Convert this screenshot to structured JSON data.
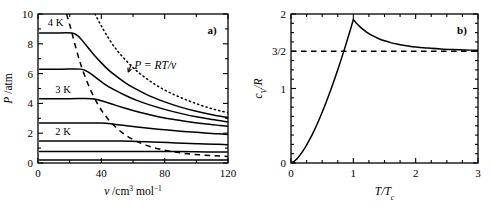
{
  "figure": {
    "panel_a_label": "a)",
    "panel_b_label": "b)"
  },
  "panel_a": {
    "xlabel_var": "v",
    "xlabel_unit": "/cm",
    "xlabel_unit_sup": "3",
    "xlabel_unit_tail": " mol",
    "xlabel_unit_sup2": "−1",
    "ylabel_var": "P",
    "ylabel_unit": "/atm",
    "xticklabels": [
      "0",
      "40",
      "80",
      "120"
    ],
    "yticklabels": [
      "0",
      "2",
      "4",
      "6",
      "8",
      "10"
    ],
    "curve_labels": [
      "4 K",
      "3 K",
      "2 K"
    ],
    "annotation": "P = RT/v"
  },
  "panel_b": {
    "xlabel": "T/T",
    "xlabel_sub": "c",
    "ylabel_var": "c",
    "ylabel_sub": "V",
    "ylabel_tail": "/R",
    "xticklabels": [
      "0",
      "1",
      "2",
      "3"
    ],
    "yticklabels": [
      "0",
      "1",
      "3/2",
      "2"
    ]
  },
  "chart_data": [
    {
      "type": "line",
      "title": "a) Isotherms of a condensing gas",
      "xlabel": "v /cm^3 mol^-1",
      "ylabel": "P /atm",
      "xlim": [
        0,
        120
      ],
      "ylim": [
        0,
        10
      ],
      "xticks": [
        0,
        40,
        80,
        120
      ],
      "yticks": [
        0,
        2,
        4,
        6,
        8,
        10
      ],
      "xminorticks": [
        20,
        60,
        100
      ],
      "yminorticks": [
        1,
        3,
        5,
        7,
        9
      ],
      "grid": false,
      "legend": "none",
      "annotations": [
        {
          "text": "4 K",
          "x": 6,
          "y": 9.45
        },
        {
          "text": "3 K",
          "x": 12,
          "y": 5.0
        },
        {
          "text": "2 K",
          "x": 12,
          "y": 2.15
        },
        {
          "text": "P = RT/v",
          "x": 74,
          "y": 6.6,
          "arrow_to": [
            57,
            6.1
          ]
        }
      ],
      "series": [
        {
          "name": "isotherm-4K",
          "style": "solid",
          "plateau_P": 8.72,
          "plateau_v_end": 21.5,
          "points": [
            [
              1,
              8.72
            ],
            [
              10,
              8.72
            ],
            [
              21.5,
              8.72
            ],
            [
              26,
              8.45
            ],
            [
              30,
              7.95
            ],
            [
              35,
              7.3
            ],
            [
              40,
              6.72
            ],
            [
              45,
              6.2
            ],
            [
              50,
              5.78
            ],
            [
              55,
              5.4
            ],
            [
              60,
              5.07
            ],
            [
              70,
              4.52
            ],
            [
              80,
              4.1
            ],
            [
              90,
              3.75
            ],
            [
              100,
              3.47
            ],
            [
              110,
              3.24
            ],
            [
              120,
              3.05
            ]
          ]
        },
        {
          "name": "isotherm-3.5K",
          "style": "solid",
          "plateau_P": 6.3,
          "plateau_v_end": 27.0,
          "points": [
            [
              1,
              6.3
            ],
            [
              15,
              6.3
            ],
            [
              27,
              6.3
            ],
            [
              32,
              6.08
            ],
            [
              37,
              5.7
            ],
            [
              42,
              5.3
            ],
            [
              48,
              4.92
            ],
            [
              55,
              4.55
            ],
            [
              62,
              4.22
            ],
            [
              70,
              3.92
            ],
            [
              80,
              3.6
            ],
            [
              90,
              3.33
            ],
            [
              100,
              3.1
            ],
            [
              110,
              2.92
            ],
            [
              120,
              2.76
            ]
          ]
        },
        {
          "name": "isotherm-3K",
          "style": "solid",
          "plateau_P": 4.32,
          "plateau_v_end": 34.0,
          "points": [
            [
              1,
              4.32
            ],
            [
              20,
              4.32
            ],
            [
              34,
              4.32
            ],
            [
              40,
              4.18
            ],
            [
              46,
              3.98
            ],
            [
              53,
              3.74
            ],
            [
              60,
              3.52
            ],
            [
              68,
              3.3
            ],
            [
              76,
              3.11
            ],
            [
              85,
              2.93
            ],
            [
              95,
              2.77
            ],
            [
              105,
              2.63
            ],
            [
              115,
              2.52
            ],
            [
              120,
              2.47
            ]
          ]
        },
        {
          "name": "isotherm-2.5K",
          "style": "solid",
          "plateau_P": 2.68,
          "plateau_v_end": 40.0,
          "points": [
            [
              1,
              2.68
            ],
            [
              25,
              2.68
            ],
            [
              40,
              2.68
            ],
            [
              48,
              2.6
            ],
            [
              56,
              2.5
            ],
            [
              64,
              2.4
            ],
            [
              73,
              2.3
            ],
            [
              82,
              2.21
            ],
            [
              92,
              2.12
            ],
            [
              102,
              2.04
            ],
            [
              112,
              1.97
            ],
            [
              120,
              1.92
            ]
          ]
        },
        {
          "name": "isotherm-2K",
          "style": "solid",
          "plateau_P": 1.48,
          "plateau_v_end": 53.0,
          "points": [
            [
              1,
              1.48
            ],
            [
              30,
              1.48
            ],
            [
              53,
              1.48
            ],
            [
              62,
              1.45
            ],
            [
              72,
              1.41
            ],
            [
              82,
              1.37
            ],
            [
              92,
              1.33
            ],
            [
              102,
              1.29
            ],
            [
              112,
              1.26
            ],
            [
              120,
              1.23
            ]
          ]
        },
        {
          "name": "isotherm-1.5K",
          "style": "solid",
          "plateau_P": 0.78,
          "plateau_v_end": 75.0,
          "points": [
            [
              1,
              0.78
            ],
            [
              40,
              0.78
            ],
            [
              75,
              0.78
            ],
            [
              88,
              0.77
            ],
            [
              100,
              0.75
            ],
            [
              110,
              0.74
            ],
            [
              120,
              0.73
            ]
          ]
        },
        {
          "name": "isotherm-1K",
          "style": "solid",
          "plateau_P": 0.2,
          "plateau_v_end": 110.0,
          "points": [
            [
              1,
              0.2
            ],
            [
              60,
              0.2
            ],
            [
              110,
              0.2
            ],
            [
              120,
              0.2
            ]
          ]
        },
        {
          "name": "ideal-gas-isotherm",
          "style": "dotted",
          "label": "P = RT/v",
          "points": [
            [
              36,
              10.0
            ],
            [
              40,
              9.2
            ],
            [
              45,
              8.3
            ],
            [
              50,
              7.55
            ],
            [
              55,
              6.95
            ],
            [
              60,
              6.4
            ],
            [
              65,
              5.95
            ],
            [
              70,
              5.55
            ],
            [
              75,
              5.2
            ],
            [
              80,
              4.9
            ],
            [
              85,
              4.63
            ],
            [
              90,
              4.4
            ],
            [
              95,
              4.18
            ],
            [
              100,
              3.98
            ],
            [
              105,
              3.8
            ],
            [
              110,
              3.64
            ],
            [
              115,
              3.5
            ],
            [
              120,
              3.37
            ]
          ]
        },
        {
          "name": "condensation-boundary",
          "style": "dashed",
          "points": [
            [
              18,
              10.0
            ],
            [
              20,
              9.3
            ],
            [
              22,
              8.5
            ],
            [
              24,
              7.7
            ],
            [
              26,
              6.95
            ],
            [
              28,
              6.3
            ],
            [
              31,
              5.45
            ],
            [
              34,
              4.72
            ],
            [
              38,
              3.9
            ],
            [
              42,
              3.25
            ],
            [
              47,
              2.62
            ],
            [
              53,
              2.05
            ],
            [
              60,
              1.58
            ],
            [
              68,
              1.2
            ],
            [
              78,
              0.9
            ],
            [
              90,
              0.68
            ],
            [
              102,
              0.55
            ],
            [
              112,
              0.48
            ],
            [
              120,
              0.44
            ]
          ]
        }
      ]
    },
    {
      "type": "line",
      "title": "b) Heat capacity of an ideal Bose gas",
      "xlabel": "T/Tc",
      "ylabel": "cV/R",
      "xlim": [
        0,
        3
      ],
      "ylim": [
        0,
        2
      ],
      "xticks": [
        0,
        1,
        2,
        3
      ],
      "yticks": [
        0,
        1,
        1.5,
        2
      ],
      "xminorticks": [
        0.25,
        0.5,
        0.75,
        1.25,
        1.5,
        1.75,
        2.25,
        2.5,
        2.75
      ],
      "yminorticks": [
        0.125,
        0.25,
        0.375,
        0.5,
        0.625,
        0.75,
        0.875,
        1.125,
        1.25,
        1.375,
        1.625,
        1.75,
        1.875
      ],
      "grid": false,
      "legend": "none",
      "peak": {
        "x": 1.0,
        "y": 1.925
      },
      "asymptote": {
        "value": 1.5,
        "style": "dashed",
        "label": "3/2"
      },
      "series": [
        {
          "name": "bose-heat-capacity-below-Tc",
          "style": "solid",
          "note": "cV/R proportional to T^(3/2) for T<Tc",
          "points": [
            [
              0,
              0
            ],
            [
              0.05,
              0.0215
            ],
            [
              0.1,
              0.0609
            ],
            [
              0.15,
              0.1118
            ],
            [
              0.2,
              0.1722
            ],
            [
              0.25,
              0.2406
            ],
            [
              0.3,
              0.3163
            ],
            [
              0.35,
              0.3985
            ],
            [
              0.4,
              0.4869
            ],
            [
              0.45,
              0.5811
            ],
            [
              0.5,
              0.6806
            ],
            [
              0.55,
              0.7852
            ],
            [
              0.6,
              0.8947
            ],
            [
              0.65,
              1.0088
            ],
            [
              0.7,
              1.1274
            ],
            [
              0.75,
              1.2503
            ],
            [
              0.8,
              1.3773
            ],
            [
              0.85,
              1.5084
            ],
            [
              0.9,
              1.6434
            ],
            [
              0.95,
              1.7822
            ],
            [
              1.0,
              1.925
            ]
          ]
        },
        {
          "name": "bose-heat-capacity-above-Tc",
          "style": "solid",
          "note": "decays from 1.925 toward 1.5 as T increases",
          "points": [
            [
              1.0,
              1.925
            ],
            [
              1.05,
              1.876
            ],
            [
              1.1,
              1.834
            ],
            [
              1.15,
              1.797
            ],
            [
              1.2,
              1.765
            ],
            [
              1.3,
              1.712
            ],
            [
              1.4,
              1.671
            ],
            [
              1.5,
              1.64
            ],
            [
              1.6,
              1.616
            ],
            [
              1.7,
              1.597
            ],
            [
              1.8,
              1.581
            ],
            [
              1.9,
              1.568
            ],
            [
              2.0,
              1.558
            ],
            [
              2.2,
              1.542
            ],
            [
              2.4,
              1.531
            ],
            [
              2.6,
              1.523
            ],
            [
              2.8,
              1.517
            ],
            [
              3.0,
              1.512
            ]
          ]
        },
        {
          "name": "classical-limit",
          "style": "dashed",
          "points": [
            [
              0,
              1.5
            ],
            [
              3,
              1.5
            ]
          ]
        }
      ]
    }
  ]
}
